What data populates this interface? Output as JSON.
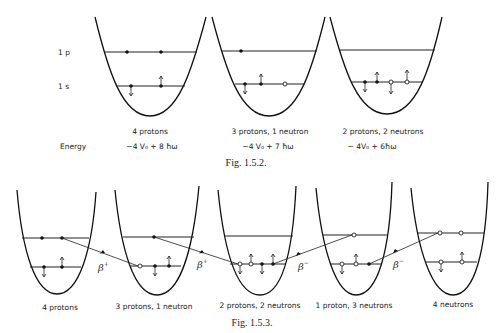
{
  "fig_1_5_2": {
    "caption": "Fig. 1.5.2.",
    "level_labels": {
      "p": "1 p",
      "s": "1 s"
    },
    "energy_label": "Energy",
    "wells": [
      {
        "name": "4 protons",
        "energy": "−4 V₀ + 8 ħω",
        "levels": {
          "1p": [
            {
              "type": "proton",
              "spin": "none"
            },
            {
              "type": "proton",
              "spin": "none"
            }
          ],
          "1s": [
            {
              "type": "proton",
              "spin": "down"
            },
            {
              "type": "proton",
              "spin": "up"
            }
          ]
        }
      },
      {
        "name": "3 protons, 1 neutron",
        "energy": "−4 V₀ + 7 ħω",
        "levels": {
          "1p": [
            {
              "type": "proton",
              "spin": "none"
            }
          ],
          "1s": [
            {
              "type": "proton",
              "spin": "down"
            },
            {
              "type": "proton",
              "spin": "up"
            },
            {
              "type": "neutron",
              "spin": "none"
            }
          ]
        }
      },
      {
        "name": "2 protons, 2 neutrons",
        "energy": "− 4V₀ + 6ħω",
        "levels": {
          "1p": [],
          "1s": [
            {
              "type": "proton",
              "spin": "down"
            },
            {
              "type": "proton",
              "spin": "up"
            },
            {
              "type": "neutron",
              "spin": "down"
            },
            {
              "type": "neutron",
              "spin": "up"
            }
          ]
        }
      }
    ]
  },
  "fig_1_5_3": {
    "caption": "Fig. 1.5.3.",
    "wells": [
      {
        "name": "4 protons"
      },
      {
        "name": "3 protons, 1 neutron"
      },
      {
        "name": "2 protons, 2 neutrons"
      },
      {
        "name": "1 proton, 3 neutrons"
      },
      {
        "name": "4 neutrons"
      }
    ],
    "transitions": [
      {
        "label": "β",
        "sign": "+"
      },
      {
        "label": "β",
        "sign": "+"
      },
      {
        "label": "β",
        "sign": "−"
      },
      {
        "label": "β",
        "sign": "−"
      }
    ]
  }
}
